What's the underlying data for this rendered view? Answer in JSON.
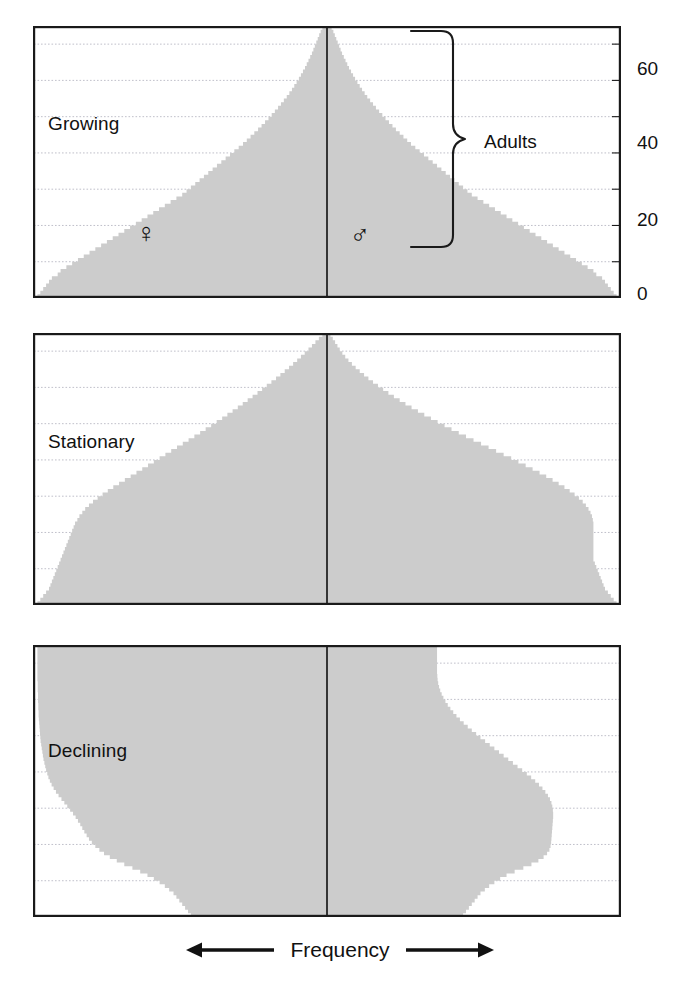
{
  "figure": {
    "caption": "Frequency",
    "left_arrow": "left-arrow",
    "right_arrow": "right-arrow",
    "fill_color": "#cccccc",
    "frame_color": "#1a1a1a",
    "grid_color": "#b9b9c4",
    "text_color": "#111111"
  },
  "axis": {
    "ylabel": "",
    "ticks": [
      {
        "value": 0,
        "label": "0"
      },
      {
        "value": 20,
        "label": "20"
      },
      {
        "value": 40,
        "label": "40"
      },
      {
        "value": 60,
        "label": "60"
      }
    ],
    "gridline_values": [
      10,
      20,
      30,
      40,
      50,
      60,
      70
    ],
    "ylim": [
      0,
      75
    ],
    "xlim": [
      -1,
      1
    ]
  },
  "annotation": {
    "bracket_label": "Adults",
    "bracket_from": 15,
    "bracket_to": 75
  },
  "symbols": {
    "female": "♀",
    "female_name": "venus-female-symbol",
    "male": "♂",
    "male_name": "mars-male-symbol"
  },
  "panels": [
    {
      "id": "growing",
      "title": "Growing",
      "has_axis": true,
      "has_annotation": true,
      "has_symbols": true
    },
    {
      "id": "stationary",
      "title": "Stationary",
      "has_axis": false,
      "has_annotation": false,
      "has_symbols": false
    },
    {
      "id": "declining",
      "title": "Declining",
      "has_axis": false,
      "has_annotation": false,
      "has_symbols": false
    }
  ],
  "chart_data": {
    "type": "area",
    "subtitle": "Growing, Stationary and Declining populations",
    "xlabel": "Frequency",
    "ylabel": "Age (years)",
    "ylim": [
      0,
      75
    ],
    "grid": true,
    "legend": "none",
    "ages": [
      0,
      1,
      2,
      3,
      4,
      5,
      6,
      7,
      8,
      9,
      10,
      11,
      12,
      13,
      14,
      15,
      16,
      17,
      18,
      19,
      20,
      21,
      22,
      23,
      24,
      25,
      26,
      27,
      28,
      29,
      30,
      31,
      32,
      33,
      34,
      35,
      36,
      37,
      38,
      39,
      40,
      41,
      42,
      43,
      44,
      45,
      46,
      47,
      48,
      49,
      50,
      51,
      52,
      53,
      54,
      55,
      56,
      57,
      58,
      59,
      60,
      61,
      62,
      63,
      64,
      65,
      66,
      67,
      68,
      69,
      70,
      71,
      72,
      73,
      74,
      75
    ],
    "series": [
      {
        "panel": "growing",
        "name": "Growing - female",
        "side": "left",
        "values": [
          1.0,
          0.99,
          0.98,
          0.97,
          0.96,
          0.95,
          0.93,
          0.92,
          0.9,
          0.88,
          0.86,
          0.84,
          0.82,
          0.8,
          0.78,
          0.76,
          0.74,
          0.72,
          0.7,
          0.68,
          0.66,
          0.64,
          0.62,
          0.6,
          0.58,
          0.56,
          0.54,
          0.52,
          0.5,
          0.485,
          0.47,
          0.455,
          0.44,
          0.425,
          0.41,
          0.395,
          0.38,
          0.365,
          0.35,
          0.335,
          0.32,
          0.305,
          0.29,
          0.277,
          0.264,
          0.251,
          0.238,
          0.226,
          0.214,
          0.202,
          0.191,
          0.18,
          0.169,
          0.159,
          0.149,
          0.139,
          0.13,
          0.121,
          0.113,
          0.105,
          0.097,
          0.09,
          0.083,
          0.076,
          0.07,
          0.064,
          0.058,
          0.052,
          0.047,
          0.042,
          0.037,
          0.032,
          0.027,
          0.022,
          0.016,
          0.0
        ]
      },
      {
        "panel": "growing",
        "name": "Growing - male",
        "side": "right",
        "values": [
          1.0,
          0.99,
          0.98,
          0.97,
          0.96,
          0.95,
          0.93,
          0.92,
          0.9,
          0.88,
          0.86,
          0.84,
          0.82,
          0.8,
          0.78,
          0.76,
          0.74,
          0.72,
          0.7,
          0.68,
          0.66,
          0.64,
          0.62,
          0.6,
          0.58,
          0.56,
          0.54,
          0.52,
          0.5,
          0.485,
          0.47,
          0.455,
          0.44,
          0.425,
          0.41,
          0.395,
          0.38,
          0.365,
          0.35,
          0.335,
          0.32,
          0.305,
          0.29,
          0.277,
          0.264,
          0.251,
          0.238,
          0.226,
          0.214,
          0.202,
          0.191,
          0.18,
          0.169,
          0.159,
          0.149,
          0.139,
          0.13,
          0.121,
          0.113,
          0.105,
          0.097,
          0.09,
          0.083,
          0.076,
          0.07,
          0.064,
          0.058,
          0.052,
          0.047,
          0.042,
          0.037,
          0.032,
          0.027,
          0.022,
          0.016,
          0.0
        ]
      },
      {
        "panel": "stationary",
        "name": "Stationary - female",
        "side": "left",
        "values": [
          1.0,
          0.99,
          0.98,
          0.97,
          0.96,
          0.955,
          0.95,
          0.945,
          0.94,
          0.935,
          0.93,
          0.925,
          0.92,
          0.915,
          0.91,
          0.905,
          0.9,
          0.895,
          0.89,
          0.885,
          0.88,
          0.875,
          0.87,
          0.862,
          0.855,
          0.845,
          0.835,
          0.822,
          0.808,
          0.792,
          0.775,
          0.757,
          0.738,
          0.718,
          0.698,
          0.678,
          0.658,
          0.638,
          0.618,
          0.598,
          0.578,
          0.558,
          0.538,
          0.518,
          0.498,
          0.478,
          0.458,
          0.438,
          0.419,
          0.4,
          0.381,
          0.362,
          0.344,
          0.326,
          0.308,
          0.291,
          0.274,
          0.257,
          0.24,
          0.224,
          0.208,
          0.192,
          0.176,
          0.161,
          0.146,
          0.131,
          0.117,
          0.103,
          0.09,
          0.077,
          0.064,
          0.052,
          0.04,
          0.028,
          0.016,
          0.0
        ]
      },
      {
        "panel": "stationary",
        "name": "Stationary - male",
        "side": "right",
        "values": [
          1.0,
          0.99,
          0.98,
          0.97,
          0.96,
          0.955,
          0.95,
          0.945,
          0.94,
          0.935,
          0.93,
          0.925,
          0.92,
          0.92,
          0.92,
          0.92,
          0.92,
          0.92,
          0.92,
          0.92,
          0.92,
          0.92,
          0.92,
          0.918,
          0.915,
          0.91,
          0.903,
          0.894,
          0.883,
          0.87,
          0.855,
          0.838,
          0.82,
          0.8,
          0.779,
          0.757,
          0.734,
          0.71,
          0.686,
          0.661,
          0.636,
          0.61,
          0.584,
          0.558,
          0.532,
          0.506,
          0.48,
          0.455,
          0.43,
          0.406,
          0.382,
          0.359,
          0.336,
          0.314,
          0.292,
          0.271,
          0.251,
          0.231,
          0.212,
          0.194,
          0.176,
          0.159,
          0.143,
          0.128,
          0.113,
          0.099,
          0.086,
          0.074,
          0.063,
          0.053,
          0.044,
          0.036,
          0.028,
          0.02,
          0.012,
          0.0
        ]
      },
      {
        "panel": "declining",
        "name": "Declining - female",
        "side": "left",
        "values": [
          0.47,
          0.48,
          0.49,
          0.5,
          0.51,
          0.52,
          0.53,
          0.545,
          0.56,
          0.578,
          0.598,
          0.62,
          0.645,
          0.672,
          0.7,
          0.726,
          0.75,
          0.77,
          0.786,
          0.8,
          0.812,
          0.822,
          0.83,
          0.838,
          0.845,
          0.852,
          0.86,
          0.868,
          0.877,
          0.887,
          0.897,
          0.907,
          0.917,
          0.927,
          0.936,
          0.944,
          0.951,
          0.957,
          0.962,
          0.966,
          0.97,
          0.973,
          0.976,
          0.979,
          0.981,
          0.983,
          0.985,
          0.987,
          0.989,
          0.99,
          0.991,
          0.992,
          0.993,
          0.994,
          0.995,
          0.996,
          0.996,
          0.997,
          0.997,
          0.998,
          0.998,
          0.998,
          0.999,
          0.999,
          0.999,
          1.0,
          1.0,
          1.0,
          1.0,
          1.0,
          1.0,
          1.0,
          1.0,
          1.0,
          1.0,
          1.0
        ]
      },
      {
        "panel": "declining",
        "name": "Declining - male",
        "side": "right",
        "values": [
          0.47,
          0.48,
          0.49,
          0.5,
          0.51,
          0.52,
          0.53,
          0.545,
          0.56,
          0.578,
          0.598,
          0.62,
          0.648,
          0.678,
          0.706,
          0.73,
          0.748,
          0.76,
          0.768,
          0.772,
          0.774,
          0.775,
          0.776,
          0.777,
          0.778,
          0.779,
          0.78,
          0.781,
          0.781,
          0.78,
          0.778,
          0.775,
          0.77,
          0.763,
          0.754,
          0.744,
          0.732,
          0.719,
          0.705,
          0.69,
          0.674,
          0.658,
          0.642,
          0.626,
          0.61,
          0.594,
          0.578,
          0.562,
          0.546,
          0.53,
          0.515,
          0.5,
          0.486,
          0.472,
          0.459,
          0.447,
          0.436,
          0.426,
          0.417,
          0.409,
          0.402,
          0.396,
          0.391,
          0.387,
          0.384,
          0.382,
          0.381,
          0.38,
          0.38,
          0.38,
          0.38,
          0.38,
          0.38,
          0.38,
          0.38,
          0.38
        ]
      }
    ]
  }
}
